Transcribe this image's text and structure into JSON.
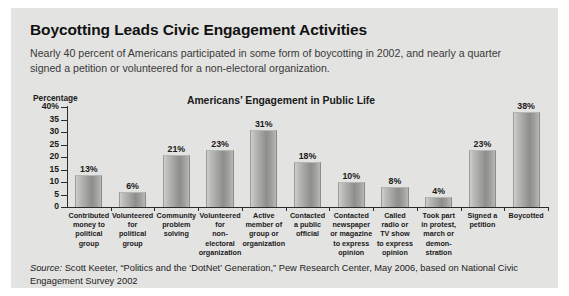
{
  "headline": "Boycotting Leads Civic Engagement Activities",
  "deck": "Nearly 40 percent of Americans participated in some form of boycotting in 2002, and nearly a quarter signed a petition or volunteered for a non-electoral organization.",
  "source": {
    "label": "Source:",
    "text": " Scott Keeter, “Politics and the ‘DotNet’ Generation,” Pew Research Center, May 2006, based on National Civic Engagement Survey 2002"
  },
  "chart_data": {
    "type": "bar",
    "title": "Americans’ Engagement in Public Life",
    "ylabel": "Percentage",
    "xlabel": "",
    "ylim": [
      0,
      40
    ],
    "yticks": [
      0,
      5,
      10,
      15,
      20,
      25,
      30,
      35,
      40
    ],
    "ytick_labels": [
      "0",
      "5",
      "10",
      "15",
      "20",
      "25",
      "30",
      "35",
      "40%"
    ],
    "grid": false,
    "legend": false,
    "bar_color": "#a0a09e",
    "categories": [
      "Contributed money to political group",
      "Volunteered for political group",
      "Community problem solving",
      "Volunteered for non-electoral organization",
      "Active member of group or organization",
      "Contacted a public official",
      "Contacted newspaper or magazine to express opinion",
      "Called radio or TV show to express opinion",
      "Took part in protest, march or demon- stration",
      "Signed a petition",
      "Boycotted"
    ],
    "category_lines": [
      [
        "Contributed",
        "money to",
        "political",
        "group"
      ],
      [
        "Volunteered",
        "for",
        "political",
        "group"
      ],
      [
        "Community",
        "problem",
        "solving"
      ],
      [
        "Volunteered",
        "for",
        "non-electoral",
        "organization"
      ],
      [
        "Active",
        "member of",
        "group or",
        "organization"
      ],
      [
        "Contacted",
        "a public",
        "official"
      ],
      [
        "Contacted",
        "newspaper",
        "or magazine",
        "to express",
        "opinion"
      ],
      [
        "Called",
        "radio or",
        "TV show",
        "to express",
        "opinion"
      ],
      [
        "Took part",
        "in protest,",
        "march or",
        "demon-",
        "stration"
      ],
      [
        "Signed a",
        "petition"
      ],
      [
        "Boycotted"
      ]
    ],
    "values": [
      13,
      6,
      21,
      23,
      31,
      18,
      10,
      8,
      4,
      23,
      38
    ],
    "value_labels": [
      "13%",
      "6%",
      "21%",
      "23%",
      "31%",
      "18%",
      "10%",
      "8%",
      "4%",
      "23%",
      "38%"
    ]
  }
}
